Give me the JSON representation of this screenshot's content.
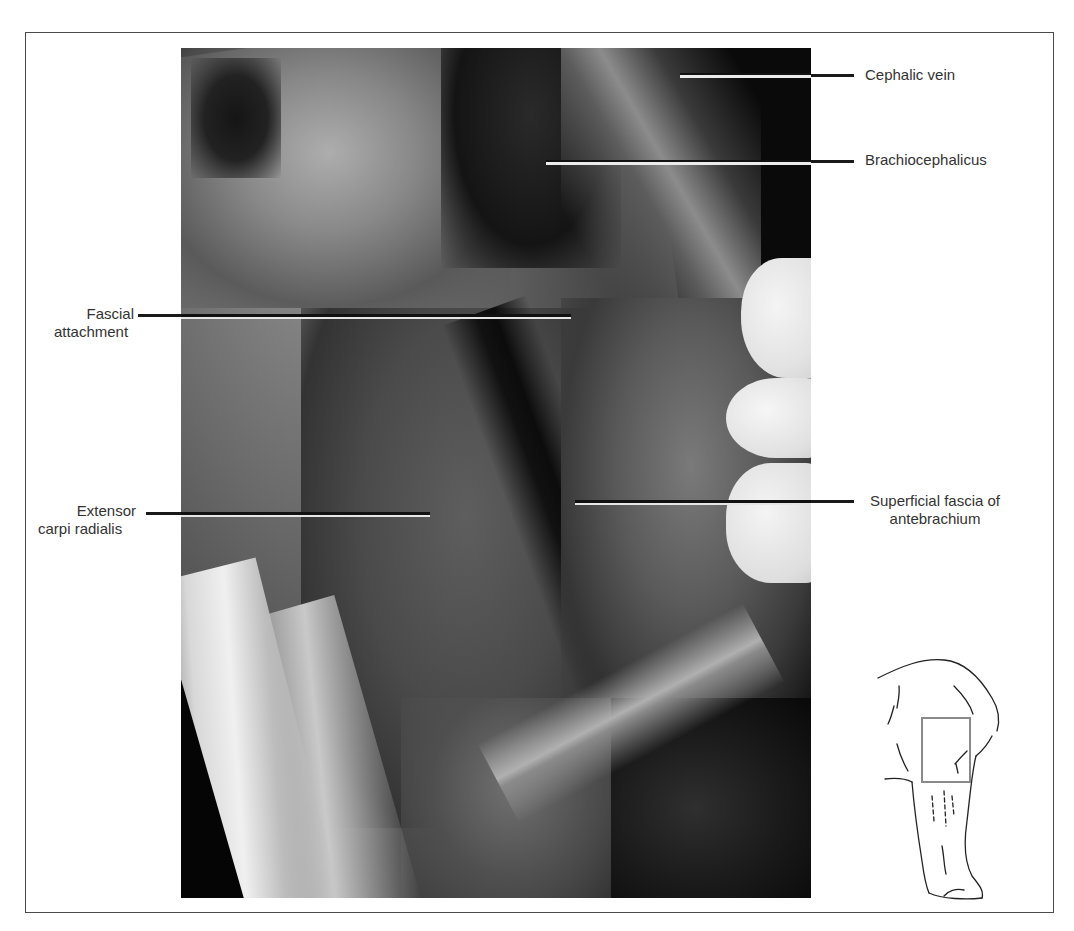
{
  "figure": {
    "type": "anatomical photograph with labels",
    "inset_sketch": "forelimb outline with highlighted region box",
    "inset_box_color": "#8a8a8a"
  },
  "labels": {
    "cephalic_vein": "Cephalic vein",
    "brachiocephalicus": "Brachiocephalicus",
    "fascial_attachment": [
      "Fascial",
      "attachment"
    ],
    "extensor_carpi_radialis": [
      "Extensor",
      "carpi radialis"
    ],
    "superficial_fascia": [
      "Superficial fascia of",
      "antebrachium"
    ]
  },
  "caption_partial": "(caption text cut off at bottom edge)"
}
